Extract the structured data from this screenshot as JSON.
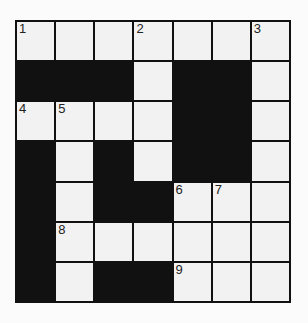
{
  "puzzle": {
    "type": "crossword",
    "rows": 7,
    "cols": 7,
    "colors": {
      "block": "#111111",
      "cell": "#f2f2f2",
      "background": "#fbfbfb"
    },
    "grid": [
      [
        "1",
        "",
        "",
        "2",
        "",
        "",
        "3"
      ],
      [
        "#",
        "#",
        "#",
        "",
        "#",
        "#",
        ""
      ],
      [
        "4",
        "5",
        "",
        "",
        "#",
        "#",
        ""
      ],
      [
        "#",
        "",
        "#",
        "",
        "#",
        "#",
        ""
      ],
      [
        "#",
        "",
        "#",
        "#",
        "6",
        "7",
        ""
      ],
      [
        "#",
        "8",
        "",
        "",
        "",
        "",
        ""
      ],
      [
        "#",
        "",
        "#",
        "#",
        "9",
        "",
        ""
      ]
    ]
  }
}
